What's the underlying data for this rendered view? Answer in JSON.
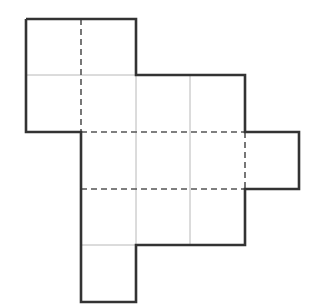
{
  "diagram": {
    "width": 313,
    "height": 308,
    "grid": {
      "x_lines": [
        26,
        81,
        136,
        190,
        245,
        299
      ],
      "y_lines": [
        19,
        75,
        132,
        189,
        245,
        302
      ],
      "cell_size": 55
    },
    "cells": [
      {
        "col": 0,
        "row": 0
      },
      {
        "col": 1,
        "row": 0
      },
      {
        "col": 0,
        "row": 1
      },
      {
        "col": 1,
        "row": 1
      },
      {
        "col": 2,
        "row": 1
      },
      {
        "col": 3,
        "row": 1
      },
      {
        "col": 1,
        "row": 2
      },
      {
        "col": 2,
        "row": 2
      },
      {
        "col": 3,
        "row": 2
      },
      {
        "col": 4,
        "row": 2
      },
      {
        "col": 1,
        "row": 3
      },
      {
        "col": 2,
        "row": 3
      },
      {
        "col": 3,
        "row": 3
      },
      {
        "col": 1,
        "row": 4
      }
    ],
    "outline_points": [
      [
        26,
        19
      ],
      [
        136,
        19
      ],
      [
        136,
        75
      ],
      [
        245,
        75
      ],
      [
        245,
        132
      ],
      [
        299,
        132
      ],
      [
        299,
        189
      ],
      [
        245,
        189
      ],
      [
        245,
        245
      ],
      [
        136,
        245
      ],
      [
        136,
        302
      ],
      [
        81,
        302
      ],
      [
        81,
        132
      ],
      [
        26,
        132
      ],
      [
        26,
        19
      ]
    ],
    "dashed_lines": [
      {
        "x1": 81,
        "y1": 19,
        "x2": 81,
        "y2": 132
      },
      {
        "x1": 81,
        "y1": 132,
        "x2": 245,
        "y2": 132
      },
      {
        "x1": 81,
        "y1": 189,
        "x2": 245,
        "y2": 189
      },
      {
        "x1": 245,
        "y1": 132,
        "x2": 245,
        "y2": 189
      }
    ],
    "thin_lines": [
      {
        "x1": 26,
        "y1": 75,
        "x2": 245,
        "y2": 75
      },
      {
        "x1": 136,
        "y1": 75,
        "x2": 136,
        "y2": 245
      },
      {
        "x1": 190,
        "y1": 75,
        "x2": 190,
        "y2": 245
      },
      {
        "x1": 81,
        "y1": 245,
        "x2": 136,
        "y2": 245
      }
    ],
    "colors": {
      "outline": "#333333",
      "dashed": "#555555",
      "thin": "#b8b8b8",
      "background": "#ffffff"
    }
  }
}
